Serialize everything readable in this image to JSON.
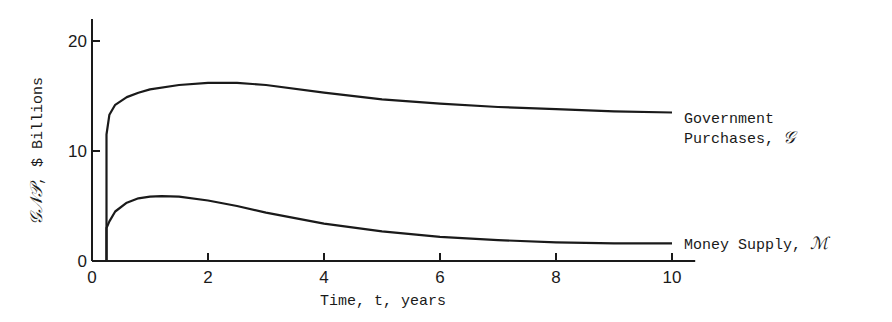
{
  "chart_data": {
    "type": "line",
    "title": "",
    "xlabel": "Time, t, years",
    "ylabel": "GNP, $ Billions",
    "ylabel_script": "𝒢𝒩𝒫",
    "ylabel_rest": ", $ Billions",
    "xlim": [
      0,
      10.4
    ],
    "ylim": [
      0,
      20
    ],
    "xticks": [
      0,
      2,
      4,
      6,
      8,
      10
    ],
    "yticks": [
      0,
      10,
      20
    ],
    "grid": false,
    "legend_position": "inline-right",
    "series": [
      {
        "name": "Government Purchases, G",
        "label_line1": "Government",
        "label_line2": "Purchases,",
        "label_symbol": "𝒢",
        "x": [
          0.25,
          0.25,
          0.3,
          0.4,
          0.6,
          0.8,
          1.0,
          1.5,
          2.0,
          2.5,
          3.0,
          4.0,
          5.0,
          6.0,
          7.0,
          8.0,
          9.0,
          10.0
        ],
        "values": [
          0,
          11.5,
          13.3,
          14.2,
          14.9,
          15.3,
          15.6,
          16.0,
          16.2,
          16.2,
          16.0,
          15.3,
          14.7,
          14.3,
          14.0,
          13.8,
          13.6,
          13.5
        ]
      },
      {
        "name": "Money Supply, M",
        "label_line1": "Money Supply,",
        "label_symbol": "ℳ",
        "x": [
          0.25,
          0.3,
          0.4,
          0.6,
          0.8,
          1.0,
          1.2,
          1.5,
          2.0,
          2.5,
          3.0,
          4.0,
          5.0,
          6.0,
          7.0,
          8.0,
          9.0,
          10.0
        ],
        "values": [
          3.0,
          3.6,
          4.5,
          5.3,
          5.7,
          5.85,
          5.9,
          5.85,
          5.5,
          5.0,
          4.4,
          3.4,
          2.7,
          2.2,
          1.9,
          1.7,
          1.6,
          1.6
        ]
      }
    ]
  }
}
